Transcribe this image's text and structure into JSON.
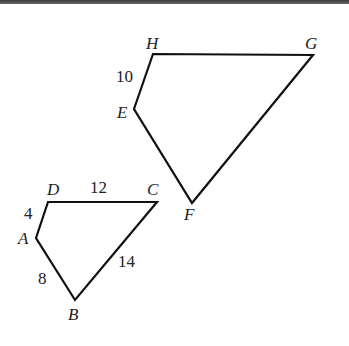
{
  "figure": {
    "small_quadrilateral": {
      "name": "ABCD",
      "vertices": [
        "A",
        "B",
        "C",
        "D"
      ],
      "side_labels": {
        "DA": "4",
        "DC": "12",
        "AB": "8",
        "BC": "14"
      }
    },
    "large_quadrilateral": {
      "name": "EFGH",
      "vertices": [
        "E",
        "F",
        "G",
        "H"
      ],
      "side_labels": {
        "HE": "10"
      }
    }
  }
}
